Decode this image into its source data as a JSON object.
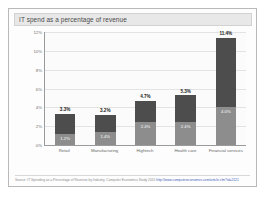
{
  "header": {
    "title": "IT spend as a percentage of revenue"
  },
  "footnote": {
    "text": "Source: IT Spending as a Percentage of Revenue by Industry, Computer Economics Study 2015 ",
    "link": "http://www.computereconomics.com/article.cfm?id=2121"
  },
  "chart_data": {
    "type": "bar",
    "title": "IT spend as a percentage of revenue",
    "xlabel": "",
    "ylabel": "",
    "ylim": [
      0,
      12
    ],
    "ytick_labels": [
      "12%",
      "10%",
      "8%",
      "6%",
      "4%",
      "2%",
      "0%"
    ],
    "ytick_values": [
      12,
      10,
      8,
      6,
      4,
      2,
      0
    ],
    "grid": true,
    "legend": false,
    "stacked": true,
    "categories": [
      "Retail",
      "Manufacturing",
      "Hightech",
      "Health care",
      "Financial services"
    ],
    "series": [
      {
        "name": "lower",
        "color": "#8d8d8d",
        "values": [
          1.2,
          1.4,
          2.4,
          2.4,
          4.0
        ],
        "labels": [
          "1.2%",
          "1.4%",
          "2.4%",
          "2.4%",
          "4.0%"
        ]
      },
      {
        "name": "upper",
        "color": "#4d4d4d",
        "values": [
          2.1,
          1.8,
          2.3,
          2.9,
          7.4
        ],
        "labels": [
          "",
          "",
          "",
          "",
          ""
        ]
      }
    ],
    "totals": [
      3.3,
      3.2,
      4.7,
      5.3,
      11.4
    ],
    "total_labels": [
      "3.3%",
      "3.2%",
      "4.7%",
      "5.3%",
      "11.4%"
    ]
  }
}
